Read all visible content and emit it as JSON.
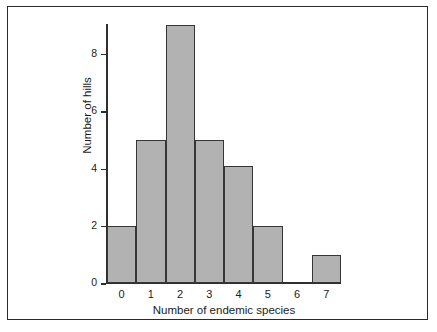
{
  "figure": {
    "background_color": "#ffffff",
    "frame_color": "#2a2a2a"
  },
  "chart_data": {
    "type": "bar",
    "title": "",
    "subtitle": "",
    "xlabel": "Number of endemic species",
    "ylabel": "Number of hills",
    "categories": [
      "0",
      "1",
      "2",
      "3",
      "4",
      "5",
      "6",
      "7"
    ],
    "values": [
      2,
      5,
      9,
      5,
      4.1,
      2,
      0,
      1
    ],
    "xlim": [
      -0.5,
      7.5
    ],
    "ylim": [
      0,
      9.3
    ],
    "ytick_labels": [
      "0",
      "2",
      "4",
      "6",
      "8"
    ],
    "ytick_values": [
      0,
      2,
      4,
      6,
      8
    ],
    "xtick_labels": [
      "0",
      "1",
      "2",
      "3",
      "4",
      "5",
      "6",
      "7"
    ],
    "grid": false,
    "legend": "none",
    "bar_fill_color": "#b2b2b2",
    "bar_edge_color": "#363636",
    "axis_color": "#2f2f2f",
    "annotations": []
  }
}
